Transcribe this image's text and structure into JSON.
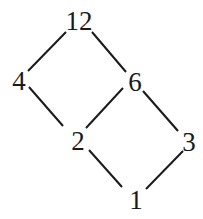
{
  "diagram": {
    "type": "hasse-diagram",
    "stroke_color": "#1a1a1a",
    "nodes": [
      {
        "id": "12",
        "label": "12",
        "x": 79,
        "y": 21
      },
      {
        "id": "4",
        "label": "4",
        "x": 19,
        "y": 81
      },
      {
        "id": "6",
        "label": "6",
        "x": 135,
        "y": 82
      },
      {
        "id": "2",
        "label": "2",
        "x": 78,
        "y": 141
      },
      {
        "id": "3",
        "label": "3",
        "x": 189,
        "y": 142
      },
      {
        "id": "1",
        "label": "1",
        "x": 136,
        "y": 200
      }
    ],
    "edges": [
      {
        "from": "12",
        "to": "4",
        "x1": 66,
        "y1": 32,
        "x2": 28,
        "y2": 71
      },
      {
        "from": "12",
        "to": "6",
        "x1": 92,
        "y1": 32,
        "x2": 126,
        "y2": 72
      },
      {
        "from": "4",
        "to": "2",
        "x1": 29,
        "y1": 87,
        "x2": 63,
        "y2": 126
      },
      {
        "from": "6",
        "to": "2",
        "x1": 123,
        "y1": 88,
        "x2": 86,
        "y2": 128
      },
      {
        "from": "6",
        "to": "3",
        "x1": 143,
        "y1": 91,
        "x2": 178,
        "y2": 131
      },
      {
        "from": "2",
        "to": "1",
        "x1": 89,
        "y1": 150,
        "x2": 122,
        "y2": 187
      },
      {
        "from": "3",
        "to": "1",
        "x1": 183,
        "y1": 151,
        "x2": 146,
        "y2": 189
      }
    ]
  }
}
